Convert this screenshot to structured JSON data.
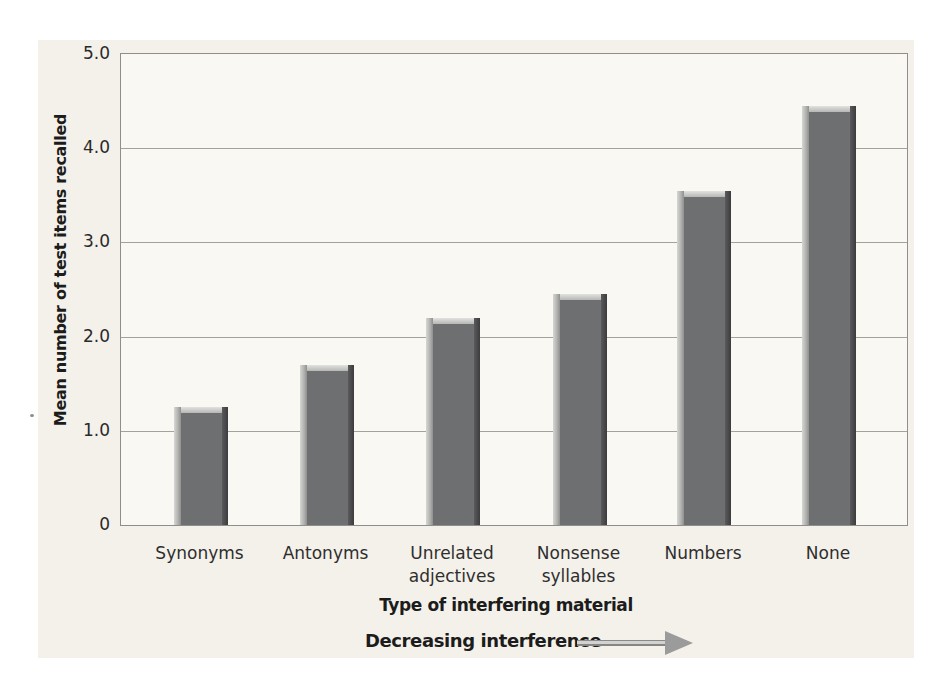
{
  "chart_data": {
    "type": "bar",
    "ylabel": "Mean number of test items recalled",
    "xlabel": "Type of interfering material",
    "ylim": [
      0,
      5
    ],
    "grid": true,
    "legend": "none",
    "yticks": [
      {
        "label": "5.0",
        "value": 5
      },
      {
        "label": "4.0",
        "value": 4
      },
      {
        "label": "3.0",
        "value": 3
      },
      {
        "label": "2.0",
        "value": 2
      },
      {
        "label": "1.0",
        "value": 1
      },
      {
        "label": "0",
        "value": 0
      }
    ],
    "categories": [
      "Synonyms",
      "Antonyms",
      "Unrelated adjectives",
      "Nonsense syllables",
      "Numbers",
      "None"
    ],
    "category_display_lines": [
      [
        "Synonyms"
      ],
      [
        "Antonyms"
      ],
      [
        "Unrelated",
        "adjectives"
      ],
      [
        "Nonsense",
        "syllables"
      ],
      [
        "Numbers"
      ],
      [
        "None"
      ]
    ],
    "values": [
      1.25,
      1.7,
      2.2,
      2.45,
      3.55,
      4.45
    ]
  },
  "annotation": {
    "label": "Decreasing interference",
    "arrow_icon": "right-arrow",
    "arrow_color": "#9b9b9b"
  },
  "colors": {
    "panel_background": "#f4f1ea",
    "plot_background": "#f9f8f3",
    "grid": "#a3a29c",
    "border": "#8e8e8c",
    "bar_body": "#6e6f71",
    "bar_highlight": "#cbcbc9",
    "bar_shadow": "#434346"
  }
}
